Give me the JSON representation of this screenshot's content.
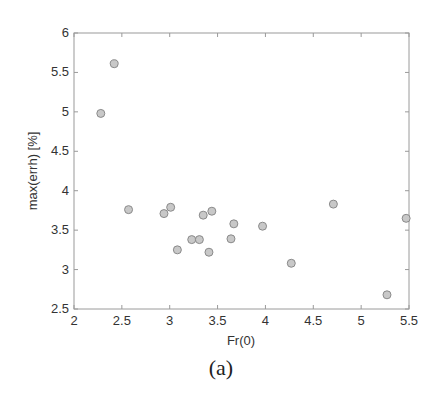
{
  "chart_data": {
    "type": "scatter",
    "title": "",
    "xlabel": "Fr(0)",
    "ylabel": "max(errh) [%]",
    "xlim": [
      2,
      5.5
    ],
    "ylim": [
      2.5,
      6
    ],
    "xticks": [
      2,
      2.5,
      3,
      3.5,
      4,
      4.5,
      5,
      5.5
    ],
    "yticks": [
      2.5,
      3,
      3.5,
      4,
      4.5,
      5,
      5.5,
      6
    ],
    "xtick_labels": [
      "2",
      "2.5",
      "3",
      "3.5",
      "4",
      "4.5",
      "5",
      "5.5"
    ],
    "ytick_labels": [
      "2.5",
      "3",
      "3.5",
      "4",
      "4.5",
      "5",
      "5.5",
      "6"
    ],
    "grid": false,
    "legend": null,
    "marker": {
      "shape": "circle",
      "fill": "#c8c8c8",
      "edge": "#8a8a8a"
    },
    "series": [
      {
        "name": "data",
        "x": [
          2.28,
          2.42,
          2.57,
          2.94,
          3.01,
          3.08,
          3.23,
          3.31,
          3.35,
          3.41,
          3.44,
          3.64,
          3.67,
          3.97,
          4.27,
          4.71,
          5.27,
          5.47
        ],
        "y": [
          4.98,
          5.61,
          3.76,
          3.71,
          3.79,
          3.25,
          3.38,
          3.38,
          3.69,
          3.22,
          3.74,
          3.39,
          3.58,
          3.55,
          3.08,
          3.83,
          2.68,
          3.65
        ]
      }
    ]
  },
  "caption": "(a)"
}
